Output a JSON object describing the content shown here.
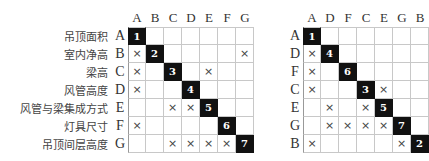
{
  "left_matrix": {
    "columns": [
      "A",
      "B",
      "C",
      "D",
      "E",
      "F",
      "G"
    ],
    "rows": [
      {
        "label": "吊顶面积",
        "key": "A",
        "cells": [
          "1",
          "",
          "",
          "",
          "",
          "",
          ""
        ]
      },
      {
        "label": "室内净高",
        "key": "B",
        "cells": [
          "×",
          "2",
          "",
          "",
          "",
          "",
          "×"
        ]
      },
      {
        "label": "梁高",
        "key": "C",
        "cells": [
          "×",
          "",
          "3",
          "",
          "×",
          "",
          ""
        ]
      },
      {
        "label": "风管高度",
        "key": "D",
        "cells": [
          "×",
          "",
          "",
          "4",
          "",
          "",
          ""
        ]
      },
      {
        "label": "风管与梁集成方式",
        "key": "E",
        "cells": [
          "",
          "",
          "×",
          "×",
          "5",
          "",
          ""
        ]
      },
      {
        "label": "灯具尺寸",
        "key": "F",
        "cells": [
          "×",
          "",
          "",
          "",
          "",
          "6",
          ""
        ]
      },
      {
        "label": "吊顶间层高度",
        "key": "G",
        "cells": [
          "",
          "",
          "×",
          "×",
          "×",
          "×",
          "7"
        ]
      }
    ]
  },
  "right_matrix": {
    "columns": [
      "A",
      "D",
      "F",
      "C",
      "E",
      "G",
      "B"
    ],
    "rows": [
      {
        "key": "A",
        "cells": [
          "1",
          "",
          "",
          "",
          "",
          "",
          ""
        ]
      },
      {
        "key": "D",
        "cells": [
          "×",
          "4",
          "",
          "",
          "",
          "",
          ""
        ]
      },
      {
        "key": "F",
        "cells": [
          "×",
          "",
          "6",
          "",
          "",
          "",
          ""
        ]
      },
      {
        "key": "C",
        "cells": [
          "×",
          "",
          "",
          "3",
          "×",
          "",
          ""
        ]
      },
      {
        "key": "E",
        "cells": [
          "",
          "×",
          "",
          "×",
          "5",
          "",
          ""
        ]
      },
      {
        "key": "G",
        "cells": [
          "",
          "×",
          "×",
          "×",
          "×",
          "7",
          ""
        ]
      },
      {
        "key": "B",
        "cells": [
          "×",
          "",
          "",
          "",
          "",
          "×",
          "2"
        ]
      }
    ]
  },
  "colors": {
    "diagonal_fill": "#111111",
    "grid_line": "#c8c8c8",
    "text": "#333333"
  }
}
